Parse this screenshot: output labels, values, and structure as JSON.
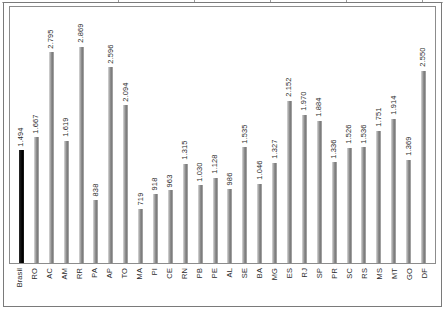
{
  "figure": {
    "background_color": "#ffffff",
    "frame_color": "#7a7a7a",
    "plot_border_color": "#8c8c8c",
    "bar_color": "#8f8f8f",
    "highlight_bar_color": "#000000",
    "label_color": "#2b2b2b"
  },
  "chart_data": {
    "type": "bar",
    "title": "",
    "subtitle": "",
    "xlabel": "",
    "ylabel": "",
    "grid": false,
    "legend": "none",
    "value_label_format": "pt-BR thousands separator (.)",
    "value_labels_rotated": true,
    "ylim": [
      0,
      3000
    ],
    "categories": [
      "Brasil",
      "RO",
      "AC",
      "AM",
      "RR",
      "PA",
      "AP",
      "TO",
      "MA",
      "PI",
      "CE",
      "RN",
      "PB",
      "PE",
      "AL",
      "SE",
      "BA",
      "MG",
      "ES",
      "RJ",
      "SP",
      "PR",
      "SC",
      "RS",
      "MS",
      "MT",
      "GO",
      "DF"
    ],
    "values": [
      1494,
      1667,
      2795,
      1619,
      2869,
      838,
      2596,
      2094,
      719,
      918,
      963,
      1315,
      1030,
      1128,
      986,
      1535,
      1046,
      1327,
      2152,
      1970,
      1884,
      1336,
      1526,
      1536,
      1751,
      1914,
      1369,
      2550
    ],
    "value_labels": [
      "1.494",
      "1.667",
      "2.795",
      "1.619",
      "2.869",
      "838",
      "2.596",
      "2.094",
      "719",
      "918",
      "963",
      "1.315",
      "1.030",
      "1.128",
      "986",
      "1.535",
      "1.046",
      "1.327",
      "2.152",
      "1.970",
      "1.884",
      "1.336",
      "1.526",
      "1.536",
      "1.751",
      "1.914",
      "1.369",
      "2.550"
    ],
    "highlight_index": 0,
    "highlight_category": "Brasil"
  }
}
